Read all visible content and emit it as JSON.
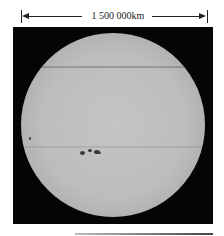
{
  "scale_bar": {
    "label": "1 500 000km",
    "color": "#222222"
  },
  "image": {
    "subject": "solar disk with sunspot group",
    "background_color": "#050505",
    "disk_color": "#bdbdbd",
    "sunspots": [
      {
        "x": 82,
        "y": 153,
        "size": 4
      },
      {
        "x": 90,
        "y": 151,
        "size": 3
      },
      {
        "x": 96,
        "y": 152,
        "size": 4
      },
      {
        "x": 30,
        "y": 138,
        "size": 2
      }
    ]
  }
}
